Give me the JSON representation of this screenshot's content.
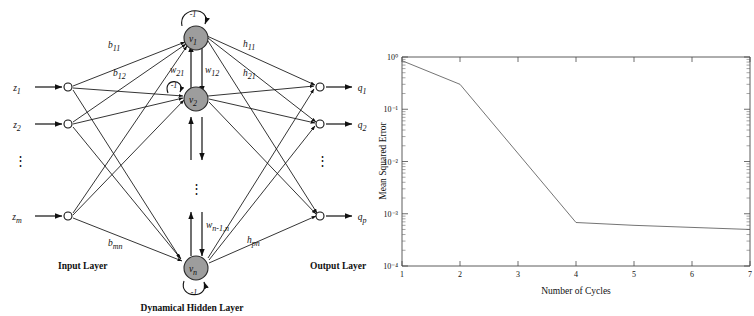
{
  "figure": {
    "panels": [
      {
        "id": "network-diagram",
        "kind": "diagram"
      },
      {
        "id": "training-curve",
        "kind": "chart"
      }
    ]
  },
  "network": {
    "captions": {
      "input_layer": "Input Layer",
      "output_layer": "Output Layer",
      "hidden_layer": "Dynamical Hidden Layer"
    },
    "inputs": [
      {
        "label": "z",
        "sub": "1"
      },
      {
        "label": "z",
        "sub": "2"
      },
      {
        "label": "z",
        "sub": "m"
      }
    ],
    "input_ellipsis": "⋮",
    "hidden_nodes": [
      {
        "label": "v",
        "sub": "1",
        "bias": "-1"
      },
      {
        "label": "v",
        "sub": "2",
        "bias": "-1"
      },
      {
        "label": "v",
        "sub": "n",
        "bias": "-1"
      }
    ],
    "hidden_ellipsis": "⋮",
    "outputs": [
      {
        "label": "q",
        "sub": "1"
      },
      {
        "label": "q",
        "sub": "2"
      },
      {
        "label": "q",
        "sub": "p"
      }
    ],
    "output_ellipsis": "⋮",
    "weight_labels": {
      "input_to_hidden": [
        {
          "label": "b",
          "sub": "11"
        },
        {
          "label": "b",
          "sub": "12"
        },
        {
          "label": "b",
          "sub": "mn"
        }
      ],
      "recurrent": [
        {
          "label": "w",
          "sub": "21"
        },
        {
          "label": "w",
          "sub": "12"
        },
        {
          "label": "w",
          "sub": "n-1,n"
        }
      ],
      "hidden_to_output": [
        {
          "label": "h",
          "sub": "11"
        },
        {
          "label": "h",
          "sub": "21"
        },
        {
          "label": "h",
          "sub": "pn"
        }
      ]
    },
    "colors": {
      "node_fill": "#9d9d9d",
      "node_stroke": "#2a2a2a",
      "edge": "#111111"
    }
  },
  "chart_data": {
    "type": "line",
    "title": "",
    "xlabel": "Number of Cycles",
    "ylabel": "Mean Squared Error",
    "xlim": [
      1,
      7
    ],
    "ylim": [
      0.0001,
      1
    ],
    "yscale": "log",
    "xscale": "linear",
    "grid": false,
    "legend": null,
    "xticks": [
      1,
      2,
      3,
      4,
      5,
      6,
      7
    ],
    "xticklabels": [
      "1",
      "2",
      "3",
      "4",
      "5",
      "6",
      "7"
    ],
    "yticks": [
      1,
      0.1,
      0.01,
      0.001,
      0.0001
    ],
    "yticklabels": [
      "10⁰",
      "10⁻¹",
      "10⁻²",
      "10⁻³",
      "10⁻⁴"
    ],
    "series": [
      {
        "name": "Mean Squared Error",
        "x": [
          1,
          2,
          4,
          5,
          7
        ],
        "values": [
          0.85,
          0.3,
          0.00068,
          0.0006,
          0.0005
        ]
      }
    ],
    "line_color": "#5b5b5b",
    "axis_color": "#4a4a4a"
  }
}
